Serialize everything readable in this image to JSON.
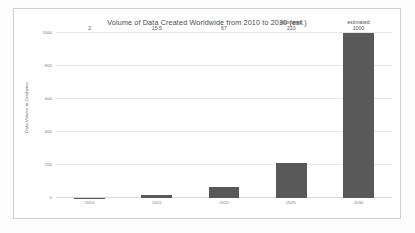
{
  "chart_data": {
    "type": "bar",
    "title": "Volume of Data Created Worldwide from 2010 to 2030 (est.)",
    "xlabel": "",
    "ylabel": "Data Volume in Zetabytes",
    "categories": [
      "2010",
      "2015",
      "2020",
      "2025",
      "2030"
    ],
    "values": [
      2,
      15.5,
      67,
      210,
      1000
    ],
    "value_labels": [
      "2",
      "15.5",
      "67",
      "210",
      "1000"
    ],
    "annotations": [
      "",
      "",
      "",
      "estimated",
      "estimated"
    ],
    "ylim": [
      0,
      1000
    ],
    "yticks": [
      0,
      200,
      400,
      600,
      800,
      1000
    ],
    "ytick_labels": [
      "0",
      "200",
      "400",
      "600",
      "800",
      "1000"
    ],
    "grid": true,
    "legend": false,
    "series": [
      {
        "name": "Data Volume",
        "values": [
          2,
          15.5,
          67,
          210,
          1000
        ],
        "color": "#595959"
      }
    ]
  },
  "style": {
    "bar_color": "#595959",
    "grid_color": "#e6e6e6",
    "border_color": "#cfcfcf",
    "background": "#ffffff",
    "text_color": "#555555",
    "tick_color": "#7a7a7a"
  }
}
